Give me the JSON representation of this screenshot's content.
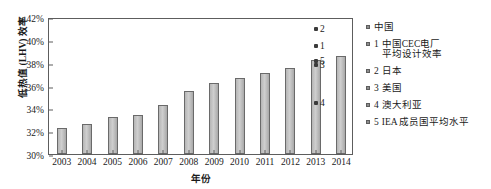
{
  "chart_data": {
    "type": "bar",
    "title": "",
    "xlabel": "年份",
    "ylabel": "低热值 (LHV) 效率",
    "categories": [
      "2003",
      "2004",
      "2005",
      "2006",
      "2007",
      "2008",
      "2009",
      "2010",
      "2011",
      "2012",
      "2013",
      "2014"
    ],
    "values": [
      32.3,
      32.6,
      33.2,
      33.4,
      34.3,
      35.5,
      36.2,
      36.7,
      37.1,
      37.5,
      38.2,
      38.6
    ],
    "series": [
      {
        "name": "中国",
        "values": [
          32.3,
          32.6,
          33.2,
          33.4,
          34.3,
          35.5,
          36.2,
          36.7,
          37.1,
          37.5,
          38.2,
          38.6
        ]
      }
    ],
    "ylim": [
      30,
      42
    ],
    "ytick_step": 2,
    "ytick_labels": [
      "30%",
      "32%",
      "34%",
      "36%",
      "38%",
      "40%",
      "42%"
    ],
    "ytick_values": [
      30,
      32,
      34,
      36,
      38,
      40,
      42
    ],
    "grid": false,
    "legend_position": "right",
    "annotations": [
      {
        "id": "1",
        "label": "中国CEC电厂平均设计效率",
        "x": "2013",
        "value": 39.6
      },
      {
        "id": "2",
        "label": "日本",
        "x": "2013",
        "value": 41.1
      },
      {
        "id": "3",
        "label": "美国",
        "x": "2013",
        "value": 38.0
      },
      {
        "id": "4",
        "label": "澳大利亚",
        "x": "2013",
        "value": 34.6
      },
      {
        "id": "5",
        "label": "IEA 成员国平均水平",
        "x": "2013",
        "value": 38.3
      }
    ]
  },
  "legend": {
    "items": [
      {
        "num": "",
        "label": "中国",
        "lines": [
          "中国"
        ]
      },
      {
        "num": "1",
        "label": "中国CEC电厂平均设计效率",
        "lines": [
          "中国CEC电厂",
          "平均设计效率"
        ]
      },
      {
        "num": "2",
        "label": "日本",
        "lines": [
          "日本"
        ]
      },
      {
        "num": "3",
        "label": "美国",
        "lines": [
          "美国"
        ]
      },
      {
        "num": "4",
        "label": "澳大利亚",
        "lines": [
          "澳大利亚"
        ]
      },
      {
        "num": "5",
        "label": "IEA 成员国平均水平",
        "lines": [
          "IEA 成员国平均水平"
        ]
      }
    ]
  },
  "colors": {
    "bar_fill": "#c8c8c8",
    "bar_stroke": "#6a6a6a",
    "axis": "#5d5d5d",
    "marker": "#3b3b3b",
    "text": "#1a1a1a",
    "background": "#ffffff"
  }
}
